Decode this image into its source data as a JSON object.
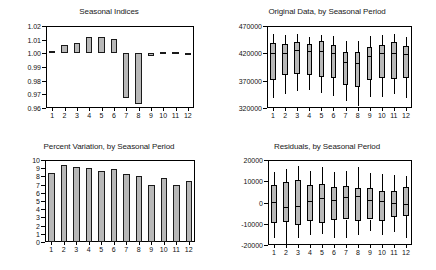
{
  "chart_data": [
    {
      "type": "bar",
      "title": "Seasonal Indices",
      "xlabel": "",
      "ylabel": "",
      "categories": [
        "1",
        "2",
        "3",
        "4",
        "5",
        "6",
        "7",
        "8",
        "9",
        "10",
        "11",
        "12"
      ],
      "values": [
        1.0018,
        1.0058,
        1.0075,
        1.0122,
        1.012,
        1.0108,
        0.9672,
        0.9632,
        0.998,
        1.0012,
        1.0012,
        0.9988
      ],
      "baseline": 1.0,
      "ylim": [
        0.96,
        1.02
      ],
      "yticks": [
        "0.96",
        "0.97",
        "0.98",
        "0.99",
        "1.00",
        "1.01",
        "1.02"
      ],
      "grid": false,
      "legend": "none"
    },
    {
      "type": "box",
      "title": "Original Data, by Seasonal Period",
      "xlabel": "",
      "ylabel": "",
      "categories": [
        "1",
        "2",
        "3",
        "4",
        "5",
        "6",
        "7",
        "8",
        "9",
        "10",
        "11",
        "12"
      ],
      "ylim": [
        320000,
        470000
      ],
      "yticks": [
        "320000",
        "370000",
        "420000",
        "470000"
      ],
      "boxes": [
        {
          "low": 339000,
          "q1": 372000,
          "median": 420000,
          "q3": 439000,
          "high": 455000
        },
        {
          "low": 345000,
          "q1": 381000,
          "median": 421000,
          "q3": 437000,
          "high": 454000
        },
        {
          "low": 351000,
          "q1": 383000,
          "median": 426000,
          "q3": 440000,
          "high": 456000
        },
        {
          "low": 352000,
          "q1": 381000,
          "median": 424000,
          "q3": 437000,
          "high": 449000
        },
        {
          "low": 348000,
          "q1": 376000,
          "median": 425000,
          "q3": 443000,
          "high": 453000
        },
        {
          "low": 342000,
          "q1": 374000,
          "median": 421000,
          "q3": 435000,
          "high": 452000
        },
        {
          "low": 332000,
          "q1": 362000,
          "median": 404000,
          "q3": 423000,
          "high": 442000
        },
        {
          "low": 323000,
          "q1": 358000,
          "median": 402000,
          "q3": 423000,
          "high": 443000
        },
        {
          "low": 341000,
          "q1": 372000,
          "median": 415000,
          "q3": 432000,
          "high": 452000
        },
        {
          "low": 340000,
          "q1": 374000,
          "median": 420000,
          "q3": 436000,
          "high": 453000
        },
        {
          "low": 345000,
          "q1": 373000,
          "median": 420000,
          "q3": 441000,
          "high": 455000
        },
        {
          "low": 339000,
          "q1": 374000,
          "median": 419000,
          "q3": 434000,
          "high": 450000
        }
      ],
      "grid": false,
      "legend": "none"
    },
    {
      "type": "bar",
      "title": "Percent Variation, by Seasonal Period",
      "xlabel": "",
      "ylabel": "",
      "categories": [
        "1",
        "2",
        "3",
        "4",
        "5",
        "6",
        "7",
        "8",
        "9",
        "10",
        "11",
        "12"
      ],
      "values": [
        8.45,
        9.35,
        9.2,
        9.0,
        8.7,
        8.85,
        8.25,
        8.05,
        7.0,
        7.75,
        7.0,
        7.5
      ],
      "baseline": 0,
      "ylim": [
        0,
        10
      ],
      "yticks": [
        "0",
        "1",
        "2",
        "3",
        "4",
        "5",
        "6",
        "7",
        "8",
        "9",
        "10"
      ],
      "grid": false,
      "legend": "none"
    },
    {
      "type": "box",
      "title": "Residuals, by Seasonal Period",
      "xlabel": "",
      "ylabel": "",
      "categories": [
        "1",
        "2",
        "3",
        "4",
        "5",
        "6",
        "7",
        "8",
        "9",
        "10",
        "11",
        "12"
      ],
      "ylim": [
        -20000,
        20000
      ],
      "yticks": [
        "-20000",
        "-10000",
        "0",
        "10000",
        "20000"
      ],
      "boxes": [
        {
          "low": -16500,
          "q1": -9500,
          "median": 300,
          "q3": 8200,
          "high": 14500
        },
        {
          "low": -20500,
          "q1": -9000,
          "median": -2000,
          "q3": 9500,
          "high": 16000
        },
        {
          "low": -16500,
          "q1": -10500,
          "median": -1800,
          "q3": 10800,
          "high": 17000
        },
        {
          "low": -15500,
          "q1": -8500,
          "median": 900,
          "q3": 8300,
          "high": 15000
        },
        {
          "low": -15000,
          "q1": -9500,
          "median": 2300,
          "q3": 8800,
          "high": 16500
        },
        {
          "low": -16500,
          "q1": -8200,
          "median": 1100,
          "q3": 7300,
          "high": 14500
        },
        {
          "low": -16500,
          "q1": -8000,
          "median": 2600,
          "q3": 7800,
          "high": 15000
        },
        {
          "low": -15500,
          "q1": -8500,
          "median": 3100,
          "q3": 6800,
          "high": 16500
        },
        {
          "low": -13500,
          "q1": -8000,
          "median": 1100,
          "q3": 6800,
          "high": 14000
        },
        {
          "low": -15500,
          "q1": -8500,
          "median": 700,
          "q3": 5600,
          "high": 13500
        },
        {
          "low": -14000,
          "q1": -7000,
          "median": -200,
          "q3": 5200,
          "high": 13000
        },
        {
          "low": -16500,
          "q1": -6500,
          "median": -500,
          "q3": 7200,
          "high": 12500
        }
      ],
      "grid": false,
      "legend": "none"
    }
  ],
  "panels": {
    "seasonal_indices": {
      "title": "Seasonal Indices"
    },
    "original_data": {
      "title": "Original Data, by Seasonal Period"
    },
    "percent_variation": {
      "title": "Percent Variation, by Seasonal Period"
    },
    "residuals": {
      "title": "Residuals, by Seasonal Period"
    }
  },
  "colors": {
    "fill": "#b8b8b8",
    "line": "#000000",
    "background": "#ffffff",
    "text": "#111111"
  }
}
